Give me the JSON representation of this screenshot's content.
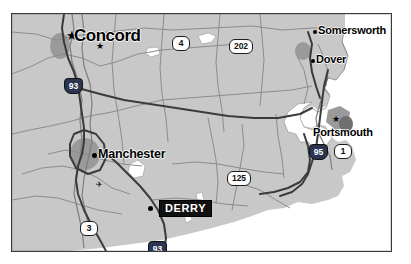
{
  "map": {
    "region_name": "Southeastern New Hampshire",
    "background_color": "#ffffff",
    "land_color": "#c8c8c8",
    "water_color": "#ffffff",
    "urban_color": "#9a9a9a",
    "border_color": "#3a3a3a",
    "road_color": "#8a8a8a",
    "highway_color": "#3b3b3b",
    "highlight_color": "#111111",
    "interstate_shield_color": "#2b3550",
    "places": [
      {
        "name": "Concord",
        "type": "state-capital",
        "marker": "star",
        "x": 57,
        "y": 22,
        "label_x": 63,
        "label_y": 14,
        "label_class": "capital"
      },
      {
        "name": "Manchester",
        "type": "major-city",
        "marker": "dot",
        "x": 82,
        "y": 141,
        "label_x": 87,
        "label_y": 134,
        "label_class": "major"
      },
      {
        "name": "DERRY",
        "type": "highlighted-city",
        "marker": "dot",
        "x": 138,
        "y": 194,
        "label_x": 148,
        "label_y": 187,
        "label_class": "highlight"
      },
      {
        "name": "Somersworth",
        "type": "city",
        "marker": "dot",
        "x": 302,
        "y": 17,
        "label_x": 307,
        "label_y": 11,
        "label_class": "city"
      },
      {
        "name": "Dover",
        "type": "city",
        "marker": "dot",
        "x": 300,
        "y": 46,
        "label_x": 305,
        "label_y": 40,
        "label_class": "city"
      },
      {
        "name": "Portsmouth",
        "type": "city",
        "marker": "star-small",
        "x": 324,
        "y": 105,
        "label_x": 302,
        "label_y": 114,
        "label_class": "city"
      }
    ],
    "route_shields": [
      {
        "number": "4",
        "type": "us",
        "x": 168,
        "y": 28,
        "width_class": "w2"
      },
      {
        "number": "202",
        "type": "us",
        "x": 228,
        "y": 31,
        "width_class": "w3"
      },
      {
        "number": "93",
        "type": "interstate",
        "x": 60,
        "y": 71,
        "width_class": "w2"
      },
      {
        "number": "125",
        "type": "us",
        "x": 226,
        "y": 163,
        "width_class": "w3"
      },
      {
        "number": "95",
        "type": "interstate",
        "x": 305,
        "y": 137,
        "width_class": "w2"
      },
      {
        "number": "1",
        "type": "us",
        "x": 330,
        "y": 137,
        "width_class": "w2"
      },
      {
        "number": "3",
        "type": "us",
        "x": 76,
        "y": 214,
        "width_class": "w2"
      },
      {
        "number": "93",
        "type": "interstate",
        "x": 144,
        "y": 234,
        "width_class": "w2"
      }
    ],
    "airport_markers": [
      {
        "x": 86,
        "y": 32
      },
      {
        "x": 94,
        "y": 170
      }
    ]
  }
}
